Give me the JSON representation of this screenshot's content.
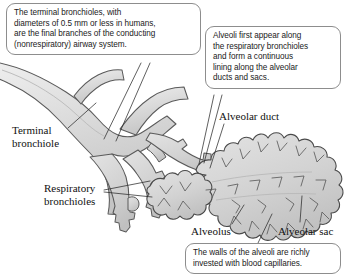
{
  "figure": {
    "background_color": "#ffffff",
    "tissue_fill_color": "#d2d2d2",
    "outline_color": "#4a4a4a",
    "callout_border_color": "#8d8d8d",
    "text_color": "#1a1a1a"
  },
  "callouts": [
    {
      "id": "terminal-bronchiole-callout",
      "text": "The terminal bronchioles, with\ndiameters of 0.5 mm or less in humans,\nare the final branches of the conducting\n(nonrespiratory) airway system."
    },
    {
      "id": "alveoli-callout",
      "text": "Alveoli first appear along\nthe respiratory bronchioles\nand form a continuous\nlining along the alveolar\nducts and sacs."
    },
    {
      "id": "capillaries-callout",
      "text": "The walls of the alveoli are richly\ninvested with blood capillaries."
    }
  ],
  "labels": {
    "terminal_bronchiole": "Terminal\nbronchiole",
    "respiratory_bronchioles": "Respiratory\nbronchioles",
    "alveolar_duct": "Alveolar duct",
    "alveolus": "Alveolus",
    "alveolar_sac": "Alveolar sac"
  }
}
